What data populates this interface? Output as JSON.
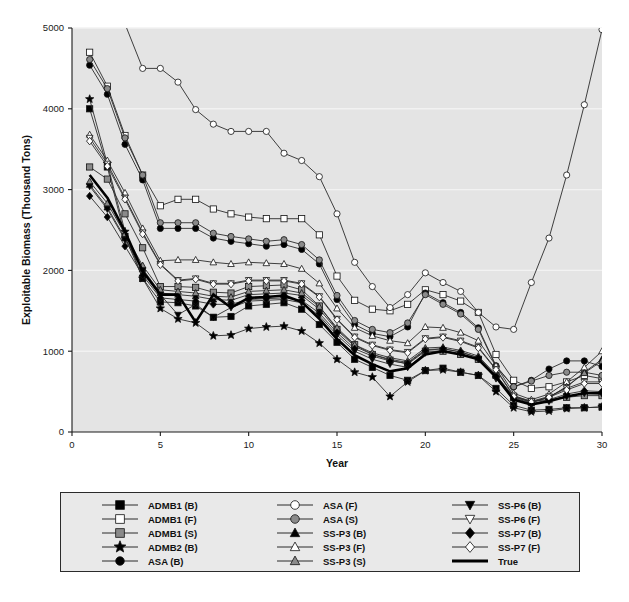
{
  "chart_data": {
    "type": "line",
    "title": "",
    "xlabel": "Year",
    "ylabel": "Exploitable Biomass (Thousand Tons)",
    "xlim": [
      0,
      30
    ],
    "ylim": [
      0,
      5000
    ],
    "xticks": [
      0,
      5,
      10,
      15,
      20,
      25,
      30
    ],
    "yticks": [
      0,
      1000,
      2000,
      3000,
      4000,
      5000
    ],
    "grid": true,
    "legend_position": "bottom",
    "x": [
      1,
      2,
      3,
      4,
      5,
      6,
      7,
      8,
      9,
      10,
      11,
      12,
      13,
      14,
      15,
      16,
      17,
      18,
      19,
      20,
      21,
      22,
      23,
      24,
      25,
      26,
      27,
      28,
      29,
      30
    ],
    "series": [
      {
        "name": "ADMB1 (B)",
        "marker": "square",
        "fill": "#000000",
        "values": [
          4000,
          3280,
          2420,
          1900,
          1610,
          1600,
          1560,
          1420,
          1430,
          1560,
          1580,
          1600,
          1520,
          1330,
          1110,
          900,
          800,
          700,
          640,
          760,
          790,
          740,
          700,
          540,
          330,
          270,
          280,
          300,
          300,
          310
        ]
      },
      {
        "name": "ADMB1 (F)",
        "marker": "square",
        "fill": "#ffffff",
        "values": [
          4700,
          4280,
          3670,
          3180,
          2800,
          2880,
          2880,
          2760,
          2700,
          2660,
          2640,
          2640,
          2640,
          2440,
          1930,
          1630,
          1520,
          1500,
          1580,
          1760,
          1700,
          1620,
          1480,
          960,
          640,
          540,
          560,
          620,
          700,
          660
        ]
      },
      {
        "name": "ADMB1 (S)",
        "marker": "square",
        "fill": "#8a8a8a",
        "values": [
          3280,
          3130,
          2700,
          2280,
          1800,
          1800,
          1790,
          1730,
          1720,
          1800,
          1810,
          1820,
          1760,
          1560,
          1270,
          1080,
          960,
          890,
          840,
          1000,
          1000,
          960,
          900,
          700,
          440,
          380,
          400,
          430,
          450,
          450
        ]
      },
      {
        "name": "ADMB2 (B)",
        "marker": "star",
        "fill": "#000000",
        "values": [
          4120,
          3320,
          2480,
          1900,
          1530,
          1400,
          1350,
          1190,
          1200,
          1280,
          1300,
          1310,
          1250,
          1100,
          900,
          740,
          680,
          440,
          620,
          760,
          770,
          740,
          700,
          500,
          300,
          250,
          260,
          290,
          300,
          310
        ]
      },
      {
        "name": "ASA (B)",
        "marker": "circle",
        "fill": "#000000",
        "values": [
          4540,
          4180,
          3560,
          3120,
          2520,
          2520,
          2520,
          2400,
          2360,
          2330,
          2300,
          2320,
          2260,
          2080,
          1640,
          1330,
          1220,
          1180,
          1300,
          1720,
          1600,
          1480,
          1290,
          820,
          560,
          640,
          780,
          880,
          880,
          810
        ]
      },
      {
        "name": "ASA (F)",
        "marker": "circle",
        "fill": "#ffffff",
        "values": [
          6200,
          5600,
          5050,
          4500,
          4500,
          4330,
          3990,
          3810,
          3720,
          3720,
          3720,
          3450,
          3360,
          3160,
          2700,
          2100,
          1800,
          1540,
          1700,
          1970,
          1850,
          1740,
          1480,
          1300,
          1270,
          1850,
          2400,
          3180,
          4050,
          4980
        ]
      },
      {
        "name": "ASA (S)",
        "marker": "circle",
        "fill": "#8a8a8a",
        "values": [
          4610,
          4250,
          3640,
          3180,
          2590,
          2590,
          2590,
          2460,
          2420,
          2390,
          2360,
          2380,
          2320,
          2130,
          1690,
          1380,
          1270,
          1230,
          1350,
          1700,
          1580,
          1460,
          1270,
          810,
          560,
          630,
          700,
          740,
          740,
          700
        ]
      },
      {
        "name": "SS-P3 (B)",
        "marker": "triangle",
        "fill": "#000000",
        "values": [
          3060,
          2780,
          2400,
          2020,
          1720,
          1700,
          1680,
          1640,
          1630,
          1700,
          1710,
          1720,
          1690,
          1520,
          1260,
          1060,
          960,
          900,
          860,
          1020,
          1030,
          990,
          920,
          700,
          420,
          360,
          430,
          560,
          740,
          900
        ]
      },
      {
        "name": "SS-P3 (F)",
        "marker": "triangle",
        "fill": "#ffffff",
        "values": [
          3680,
          3360,
          2960,
          2520,
          2120,
          2130,
          2130,
          2100,
          2080,
          2100,
          2090,
          2080,
          2020,
          1840,
          1530,
          1290,
          1190,
          1130,
          1100,
          1300,
          1290,
          1230,
          1130,
          820,
          480,
          400,
          470,
          620,
          800,
          1000
        ]
      },
      {
        "name": "SS-P3 (S)",
        "marker": "triangle",
        "fill": "#8a8a8a",
        "values": [
          3100,
          2830,
          2450,
          2060,
          1760,
          1740,
          1720,
          1680,
          1670,
          1740,
          1750,
          1760,
          1720,
          1550,
          1290,
          1080,
          980,
          920,
          880,
          1040,
          1050,
          1010,
          940,
          710,
          430,
          370,
          430,
          560,
          730,
          880
        ]
      },
      {
        "name": "SS-P6 (B)",
        "marker": "triangle-down",
        "fill": "#000000",
        "values": [
          3040,
          2760,
          2380,
          2000,
          1700,
          1450,
          1580,
          1420,
          1540,
          1620,
          1630,
          1640,
          1600,
          1440,
          1200,
          1000,
          900,
          840,
          800,
          980,
          1010,
          970,
          900,
          660,
          400,
          340,
          380,
          440,
          480,
          470
        ]
      },
      {
        "name": "SS-P6 (F)",
        "marker": "triangle-down",
        "fill": "#ffffff",
        "values": [
          3640,
          3320,
          2900,
          2470,
          2080,
          1880,
          1900,
          1840,
          1840,
          1880,
          1880,
          1880,
          1840,
          1680,
          1400,
          1180,
          1080,
          1020,
          990,
          1160,
          1180,
          1130,
          1050,
          780,
          450,
          380,
          440,
          540,
          620,
          620
        ]
      },
      {
        "name": "SS-P7 (B)",
        "marker": "diamond",
        "fill": "#000000",
        "values": [
          2920,
          2660,
          2300,
          1940,
          1660,
          1640,
          1620,
          1580,
          1580,
          1640,
          1650,
          1660,
          1630,
          1470,
          1230,
          1030,
          940,
          880,
          850,
          1010,
          1030,
          990,
          920,
          690,
          410,
          350,
          400,
          470,
          510,
          500
        ]
      },
      {
        "name": "SS-P7 (F)",
        "marker": "diamond",
        "fill": "#ffffff",
        "values": [
          3600,
          3290,
          2880,
          2450,
          2070,
          1870,
          1890,
          1830,
          1830,
          1870,
          1870,
          1870,
          1830,
          1670,
          1390,
          1170,
          1070,
          1010,
          980,
          1150,
          1170,
          1120,
          1040,
          770,
          440,
          370,
          430,
          520,
          600,
          600
        ]
      },
      {
        "name": "True",
        "marker": "none",
        "fill": "#000000",
        "values": [
          3180,
          2900,
          2480,
          1990,
          1700,
          1700,
          1360,
          1700,
          1540,
          1660,
          1670,
          1690,
          1610,
          1400,
          1150,
          950,
          840,
          750,
          790,
          960,
          1000,
          960,
          900,
          680,
          400,
          340,
          380,
          440,
          480,
          480
        ]
      }
    ]
  },
  "legend": {
    "columns": [
      [
        {
          "label": "ADMB1 (B)",
          "marker": "square",
          "fill": "#000000"
        },
        {
          "label": "ADMB1 (F)",
          "marker": "square",
          "fill": "#ffffff"
        },
        {
          "label": "ADMB1 (S)",
          "marker": "square",
          "fill": "#8a8a8a"
        },
        {
          "label": "ADMB2 (B)",
          "marker": "star",
          "fill": "#000000"
        },
        {
          "label": "ASA (B)",
          "marker": "circle",
          "fill": "#000000"
        }
      ],
      [
        {
          "label": "ASA (F)",
          "marker": "circle",
          "fill": "#ffffff"
        },
        {
          "label": "ASA (S)",
          "marker": "circle",
          "fill": "#8a8a8a"
        },
        {
          "label": "SS-P3 (B)",
          "marker": "triangle",
          "fill": "#000000"
        },
        {
          "label": "SS-P3 (F)",
          "marker": "triangle",
          "fill": "#ffffff"
        },
        {
          "label": "SS-P3 (S)",
          "marker": "triangle",
          "fill": "#8a8a8a"
        }
      ],
      [
        {
          "label": "SS-P6 (B)",
          "marker": "triangle-down",
          "fill": "#000000"
        },
        {
          "label": "SS-P6 (F)",
          "marker": "triangle-down",
          "fill": "#ffffff"
        },
        {
          "label": "SS-P7 (B)",
          "marker": "diamond",
          "fill": "#000000"
        },
        {
          "label": "SS-P7 (F)",
          "marker": "diamond",
          "fill": "#ffffff"
        },
        {
          "label": "True",
          "marker": "none",
          "fill": "#000000"
        }
      ]
    ]
  },
  "colors": {
    "plot_background": "#e4e4e4",
    "page_background": "#ffffff",
    "line": "#2b2b2b",
    "grid": "#f2f2f2",
    "axis": "#1a1a1a",
    "marker_black": "#000000",
    "marker_white": "#ffffff",
    "marker_grey": "#8a8a8a"
  }
}
